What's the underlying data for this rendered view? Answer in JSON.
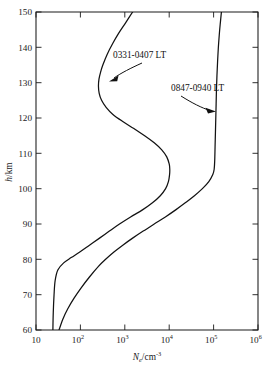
{
  "figure": {
    "background_color": "#ffffff",
    "line_color": "#121212"
  },
  "chart_data": {
    "type": "line",
    "title": "",
    "subtitle": "",
    "xlabel": "Ne/cm-3",
    "xlabel_parts": {
      "symbol": "N",
      "subscript": "e",
      "unit_base": "/cm",
      "unit_exponent": "-3"
    },
    "ylabel": "h/km",
    "ylabel_parts": {
      "symbol": "h",
      "unit": "/km"
    },
    "xscale": "log",
    "yscale": "linear",
    "xlim": [
      10,
      1000000
    ],
    "ylim": [
      60,
      150
    ],
    "grid": false,
    "legend_position": "inline-annotations",
    "x_ticks": [
      10,
      100,
      1000,
      10000,
      100000,
      1000000
    ],
    "x_tick_labels": [
      "10",
      "10^2",
      "10^3",
      "10^4",
      "10^5",
      "10^6"
    ],
    "x_tick_mantissas": [
      "10",
      "10",
      "10",
      "10",
      "10",
      "10"
    ],
    "x_tick_exponents": [
      "",
      "2",
      "3",
      "4",
      "5",
      "6"
    ],
    "y_ticks": [
      60,
      70,
      80,
      90,
      100,
      110,
      120,
      130,
      140,
      150
    ],
    "y_tick_labels": [
      "60",
      "70",
      "80",
      "90",
      "100",
      "110",
      "120",
      "130",
      "140",
      "150"
    ],
    "series": [
      {
        "name": "0331-0407 LT",
        "description": "nighttime electron density profile",
        "color": "#121212",
        "points": [
          [
            60,
            24
          ],
          [
            65,
            24.5
          ],
          [
            70,
            25.5
          ],
          [
            74,
            27
          ],
          [
            77,
            31
          ],
          [
            79,
            42
          ],
          [
            80.5,
            62
          ],
          [
            82,
            95
          ],
          [
            84,
            160
          ],
          [
            86,
            270
          ],
          [
            88,
            450
          ],
          [
            90,
            760
          ],
          [
            92,
            1350
          ],
          [
            94,
            2500
          ],
          [
            96,
            4200
          ],
          [
            98,
            6300
          ],
          [
            100,
            8300
          ],
          [
            102,
            9600
          ],
          [
            104,
            10200
          ],
          [
            105.5,
            10300
          ],
          [
            107,
            10000
          ],
          [
            109,
            8800
          ],
          [
            111,
            6800
          ],
          [
            113,
            4600
          ],
          [
            115,
            2800
          ],
          [
            117,
            1600
          ],
          [
            119,
            900
          ],
          [
            121,
            540
          ],
          [
            123,
            380
          ],
          [
            125,
            300
          ],
          [
            127,
            265
          ],
          [
            129,
            255
          ],
          [
            131,
            262
          ],
          [
            133,
            285
          ],
          [
            135,
            320
          ],
          [
            138,
            400
          ],
          [
            141,
            530
          ],
          [
            144,
            730
          ],
          [
            147,
            1050
          ],
          [
            150,
            1500
          ]
        ]
      },
      {
        "name": "0847-0940 LT",
        "description": "daytime electron density profile",
        "color": "#121212",
        "points": [
          [
            60,
            33
          ],
          [
            63,
            40
          ],
          [
            66,
            52
          ],
          [
            69,
            72
          ],
          [
            72,
            105
          ],
          [
            75,
            160
          ],
          [
            78,
            255
          ],
          [
            80,
            370
          ],
          [
            82,
            560
          ],
          [
            84,
            900
          ],
          [
            86,
            1500
          ],
          [
            88,
            2600
          ],
          [
            90,
            4600
          ],
          [
            92,
            8200
          ],
          [
            94,
            14000
          ],
          [
            96,
            23000
          ],
          [
            98,
            37000
          ],
          [
            100,
            56000
          ],
          [
            102,
            78000
          ],
          [
            104,
            96000
          ],
          [
            105.5,
            103000
          ],
          [
            108,
            106000
          ],
          [
            112,
            108000
          ],
          [
            116,
            110000
          ],
          [
            120,
            112000
          ],
          [
            124,
            114000
          ],
          [
            128,
            116000
          ],
          [
            132,
            119000
          ],
          [
            136,
            123000
          ],
          [
            140,
            128000
          ],
          [
            144,
            135000
          ],
          [
            147,
            142000
          ],
          [
            150,
            150000
          ]
        ]
      }
    ],
    "annotations": [
      {
        "label": "0331-0407 LT",
        "text_x_px": 113,
        "text_y_px": 56,
        "target_series": "0331-0407 LT",
        "arrow_points_to": "night curve near 130 km"
      },
      {
        "label": "0847-0940 LT",
        "text_x_px": 171,
        "text_y_px": 89,
        "target_series": "0847-0940 LT",
        "arrow_points_to": "day curve near 122 km"
      }
    ]
  }
}
